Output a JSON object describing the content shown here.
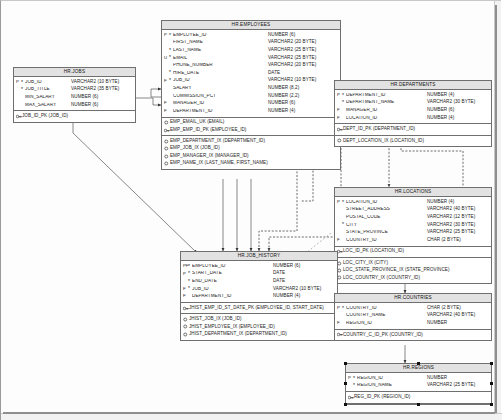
{
  "diagram": {
    "key_legend": {
      "pk": "P",
      "uk": "U",
      "fk": "F",
      "notnull": "*"
    }
  },
  "entities": [
    {
      "id": "hr_jobs",
      "name": "HR.JOBS",
      "columns": [
        {
          "key": "P",
          "null": "*",
          "name": "JOB_ID",
          "type": "VARCHAR2 (10 BYTE)"
        },
        {
          "key": "",
          "null": "*",
          "name": "JOB_TITLE",
          "type": "VARCHAR2 (35 BYTE)"
        },
        {
          "key": "",
          "null": "",
          "name": "MIN_SALARY",
          "type": "NUMBER (6)"
        },
        {
          "key": "",
          "null": "",
          "name": "MAX_SALARY",
          "type": "NUMBER (6)"
        }
      ],
      "keys": [
        {
          "icon": "pk-icon",
          "label": "JOB_ID_PK (JOB_ID)"
        }
      ],
      "indexes": []
    },
    {
      "id": "hr_employees",
      "name": "HR.EMPLOYEES",
      "columns": [
        {
          "key": "P",
          "null": "*",
          "name": "EMPLOYEE_ID",
          "type": "NUMBER (6)"
        },
        {
          "key": "",
          "null": "",
          "name": "FIRST_NAME",
          "type": "VARCHAR2 (20 BYTE)"
        },
        {
          "key": "",
          "null": "*",
          "name": "LAST_NAME",
          "type": "VARCHAR2 (25 BYTE)"
        },
        {
          "key": "U",
          "null": "*",
          "name": "EMAIL",
          "type": "VARCHAR2 (25 BYTE)"
        },
        {
          "key": "",
          "null": "",
          "name": "PHONE_NUMBER",
          "type": "VARCHAR2 (20 BYTE)"
        },
        {
          "key": "",
          "null": "*",
          "name": "HIRE_DATE",
          "type": "DATE"
        },
        {
          "key": "F",
          "null": "*",
          "name": "JOB_ID",
          "type": "VARCHAR2 (10 BYTE)"
        },
        {
          "key": "",
          "null": "",
          "name": "SALARY",
          "type": "NUMBER (8,2)"
        },
        {
          "key": "",
          "null": "",
          "name": "COMMISSION_PCT",
          "type": "NUMBER (2,2)"
        },
        {
          "key": "F",
          "null": "",
          "name": "MANAGER_ID",
          "type": "NUMBER (6)"
        },
        {
          "key": "F",
          "null": "",
          "name": "DEPARTMENT_ID",
          "type": "NUMBER (4)"
        }
      ],
      "keys": [
        {
          "icon": "uk-icon",
          "label": "EMP_EMAIL_UK (EMAIL)"
        },
        {
          "icon": "pk-icon",
          "label": "EMP_EMP_ID_PK (EMPLOYEE_ID)"
        }
      ],
      "indexes": [
        {
          "icon": "index-icon",
          "label": "EMP_DEPARTMENT_IX (DEPARTMENT_ID)"
        },
        {
          "icon": "index-icon",
          "label": "EMP_JOB_IX (JOB_ID)"
        },
        {
          "icon": "index-icon",
          "label": "EMP_MANAGER_IX (MANAGER_ID)"
        },
        {
          "icon": "index-icon",
          "label": "EMP_NAME_IX (LAST_NAME, FIRST_NAME)"
        }
      ]
    },
    {
      "id": "hr_departments",
      "name": "HR.DEPARTMENTS",
      "columns": [
        {
          "key": "P",
          "null": "*",
          "name": "DEPARTMENT_ID",
          "type": "NUMBER (4)"
        },
        {
          "key": "",
          "null": "*",
          "name": "DEPARTMENT_NAME",
          "type": "VARCHAR2 (30 BYTE)"
        },
        {
          "key": "F",
          "null": "",
          "name": "MANAGER_ID",
          "type": "NUMBER (6)"
        },
        {
          "key": "F",
          "null": "",
          "name": "LOCATION_ID",
          "type": "NUMBER (4)"
        }
      ],
      "keys": [
        {
          "icon": "pk-icon",
          "label": "DEPT_ID_PK (DEPARTMENT_ID)"
        }
      ],
      "indexes": [
        {
          "icon": "index-icon",
          "label": "DEPT_LOCATION_IX (LOCATION_ID)"
        }
      ]
    },
    {
      "id": "hr_locations",
      "name": "HR.LOCATIONS",
      "columns": [
        {
          "key": "P",
          "null": "*",
          "name": "LOCATION_ID",
          "type": "NUMBER (4)"
        },
        {
          "key": "",
          "null": "",
          "name": "STREET_ADDRESS",
          "type": "VARCHAR2 (40 BYTE)"
        },
        {
          "key": "",
          "null": "",
          "name": "POSTAL_CODE",
          "type": "VARCHAR2 (12 BYTE)"
        },
        {
          "key": "",
          "null": "*",
          "name": "CITY",
          "type": "VARCHAR2 (30 BYTE)"
        },
        {
          "key": "",
          "null": "",
          "name": "STATE_PROVINCE",
          "type": "VARCHAR2 (25 BYTE)"
        },
        {
          "key": "F",
          "null": "",
          "name": "COUNTRY_ID",
          "type": "CHAR (2 BYTE)"
        }
      ],
      "keys": [
        {
          "icon": "pk-icon",
          "label": "LOC_ID_PK (LOCATION_ID)"
        }
      ],
      "indexes": [
        {
          "icon": "index-icon",
          "label": "LOC_CITY_IX (CITY)"
        },
        {
          "icon": "index-icon",
          "label": "LOC_STATE_PROVINCE_IX (STATE_PROVINCE)"
        },
        {
          "icon": "index-icon",
          "label": "LOC_COUNTRY_IX (COUNTRY_ID)"
        }
      ]
    },
    {
      "id": "hr_job_history",
      "name": "HR.JOB_HISTORY",
      "columns": [
        {
          "key": "PF",
          "null": "*",
          "name": "EMPLOYEE_ID",
          "type": "NUMBER (6)"
        },
        {
          "key": "P",
          "null": "*",
          "name": "START_DATE",
          "type": "DATE"
        },
        {
          "key": "",
          "null": "*",
          "name": "END_DATE",
          "type": "DATE"
        },
        {
          "key": "F",
          "null": "*",
          "name": "JOB_ID",
          "type": "VARCHAR2 (10 BYTE)"
        },
        {
          "key": "F",
          "null": "",
          "name": "DEPARTMENT_ID",
          "type": "NUMBER (4)"
        }
      ],
      "keys": [
        {
          "icon": "pk-icon",
          "label": "JHIST_EMP_ID_ST_DATE_PK (EMPLOYEE_ID, START_DATE)"
        }
      ],
      "indexes": [
        {
          "icon": "index-icon",
          "label": "JHIST_JOB_IX (JOB_ID)"
        },
        {
          "icon": "index-icon",
          "label": "JHIST_EMPLOYEE_IX (EMPLOYEE_ID)"
        },
        {
          "icon": "index-icon",
          "label": "JHIST_DEPARTMENT_IX (DEPARTMENT_ID)"
        }
      ]
    },
    {
      "id": "hr_countries",
      "name": "HR.COUNTRIES",
      "columns": [
        {
          "key": "P",
          "null": "*",
          "name": "COUNTRY_ID",
          "type": "CHAR (2 BYTE)"
        },
        {
          "key": "",
          "null": "",
          "name": "COUNTRY_NAME",
          "type": "VARCHAR2 (40 BYTE)"
        },
        {
          "key": "F",
          "null": "",
          "name": "REGION_ID",
          "type": "NUMBER"
        }
      ],
      "keys": [
        {
          "icon": "pk-icon",
          "label": "COUNTRY_C_ID_PK (COUNTRY_ID)"
        }
      ],
      "indexes": []
    },
    {
      "id": "hr_regions",
      "name": "HR.REGIONS",
      "selected": true,
      "columns": [
        {
          "key": "P",
          "null": "*",
          "name": "REGION_ID",
          "type": "NUMBER"
        },
        {
          "key": "",
          "null": "*",
          "name": "REGION_NAME",
          "type": "VARCHAR2 (25 BYTE)"
        }
      ],
      "keys": [
        {
          "icon": "pk-icon",
          "label": "REG_ID_PK (REGION_ID)"
        }
      ],
      "indexes": []
    }
  ]
}
